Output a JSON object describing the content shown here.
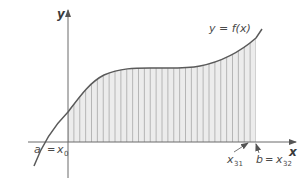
{
  "figure": {
    "type": "riemann-sum-diagram",
    "axes": {
      "x_label": "x",
      "y_label": "y"
    },
    "curve_label": "y = f(x)",
    "labels": {
      "a": "a",
      "eq": "=",
      "x0_base": "x",
      "x0_sub": "0",
      "x31_base": "x",
      "x31_sub": "31",
      "b": "b",
      "x32_base": "x",
      "x32_sub": "32"
    },
    "strips": 32,
    "colors": {
      "curve": "#5a5a5a",
      "axis": "#6a6a6a",
      "shade": "#e8e8e8",
      "strip_line": "#b0b0b0",
      "text": "#4a4a4a"
    }
  }
}
